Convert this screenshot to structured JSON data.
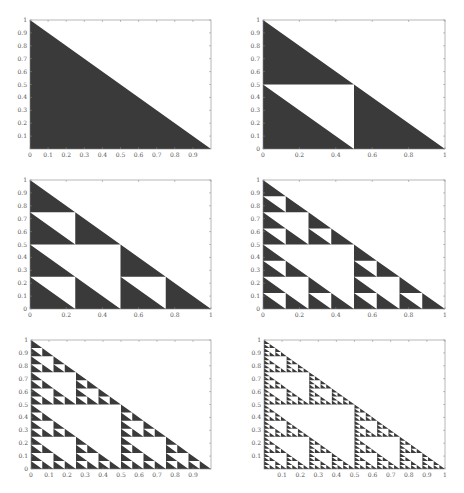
{
  "figure": {
    "fill_color": "#3a3a3a",
    "axis_color": "#888888",
    "background": "#ffffff"
  },
  "chart_data": [
    {
      "type": "area",
      "title": "",
      "description": "Right triangle with vertices (0,0),(1,0),(0,1) — Sierpinski-like fractal level 0",
      "level": 0,
      "xlim": [
        0,
        1
      ],
      "ylim": [
        0,
        1
      ],
      "xticks": [
        "0",
        "0.1",
        "0.2",
        "0.3",
        "0.4",
        "0.5",
        "0.6",
        "0.7",
        "0.8",
        "0.9"
      ],
      "xtick_values": [
        0,
        0.1,
        0.2,
        0.3,
        0.4,
        0.5,
        0.6,
        0.7,
        0.8,
        0.9
      ],
      "yticks": [
        "0.1",
        "0.2",
        "0.3",
        "0.4",
        "0.5",
        "0.6",
        "0.7",
        "0.8",
        "0.9",
        "1"
      ],
      "ytick_values": [
        0.1,
        0.2,
        0.3,
        0.4,
        0.5,
        0.6,
        0.7,
        0.8,
        0.9,
        1
      ],
      "grid": false
    },
    {
      "type": "area",
      "description": "Fractal level 1: upper-left square [0,0.5]x[0,0.5] region split; white square removed",
      "level": 1,
      "xlim": [
        0,
        1
      ],
      "ylim": [
        0,
        1
      ],
      "xticks": [
        "0",
        "0.2",
        "0.4",
        "0.6",
        "0.8",
        "1"
      ],
      "xtick_values": [
        0,
        0.2,
        0.4,
        0.6,
        0.8,
        1
      ],
      "yticks": [
        "0",
        "0.1",
        "0.2",
        "0.3",
        "0.4",
        "0.5",
        "0.6",
        "0.7",
        "0.8",
        "0.9",
        "1"
      ],
      "ytick_values": [
        0,
        0.1,
        0.2,
        0.3,
        0.4,
        0.5,
        0.6,
        0.7,
        0.8,
        0.9,
        1
      ],
      "grid": false
    },
    {
      "type": "area",
      "description": "Fractal level 2",
      "level": 2,
      "xlim": [
        0,
        1
      ],
      "ylim": [
        0,
        1
      ],
      "xticks": [
        "0",
        "0.2",
        "0.4",
        "0.6",
        "0.8",
        "1"
      ],
      "xtick_values": [
        0,
        0.2,
        0.4,
        0.6,
        0.8,
        1
      ],
      "yticks": [
        "0",
        "0.1",
        "0.2",
        "0.3",
        "0.4",
        "0.5",
        "0.6",
        "0.7",
        "0.8",
        "0.9",
        "1"
      ],
      "ytick_values": [
        0,
        0.1,
        0.2,
        0.3,
        0.4,
        0.5,
        0.6,
        0.7,
        0.8,
        0.9,
        1
      ],
      "grid": false
    },
    {
      "type": "area",
      "description": "Fractal level 3",
      "level": 3,
      "xlim": [
        0,
        1
      ],
      "ylim": [
        0,
        1
      ],
      "xticks": [
        "0",
        "0.2",
        "0.4",
        "0.6",
        "0.8",
        "1"
      ],
      "xtick_values": [
        0,
        0.2,
        0.4,
        0.6,
        0.8,
        1
      ],
      "yticks": [
        "0",
        "0.1",
        "0.2",
        "0.3",
        "0.4",
        "0.5",
        "0.6",
        "0.7",
        "0.8",
        "0.9",
        "1"
      ],
      "ytick_values": [
        0,
        0.1,
        0.2,
        0.3,
        0.4,
        0.5,
        0.6,
        0.7,
        0.8,
        0.9,
        1
      ],
      "grid": false
    },
    {
      "type": "area",
      "description": "Fractal level 4",
      "level": 4,
      "xlim": [
        0,
        1
      ],
      "ylim": [
        0,
        1
      ],
      "xticks": [
        "0",
        "0.1",
        "0.2",
        "0.3",
        "0.4",
        "0.5",
        "0.6",
        "0.7",
        "0.8",
        "0.9"
      ],
      "xtick_values": [
        0,
        0.1,
        0.2,
        0.3,
        0.4,
        0.5,
        0.6,
        0.7,
        0.8,
        0.9
      ],
      "yticks": [
        "0",
        "0.1",
        "0.2",
        "0.3",
        "0.4",
        "0.5",
        "0.6",
        "0.7",
        "0.8",
        "0.9",
        "1"
      ],
      "ytick_values": [
        0,
        0.1,
        0.2,
        0.3,
        0.4,
        0.5,
        0.6,
        0.7,
        0.8,
        0.9,
        1
      ],
      "grid": false
    },
    {
      "type": "area",
      "description": "Fractal level 5",
      "level": 5,
      "xlim": [
        0,
        1
      ],
      "ylim": [
        0,
        1
      ],
      "xticks": [
        "0.1",
        "0.2",
        "0.3",
        "0.4",
        "0.5",
        "0.6",
        "0.7",
        "0.8",
        "0.9",
        "1"
      ],
      "xtick_values": [
        0.1,
        0.2,
        0.3,
        0.4,
        0.5,
        0.6,
        0.7,
        0.8,
        0.9,
        1
      ],
      "yticks": [
        "0.1",
        "0.2",
        "0.3",
        "0.4",
        "0.5",
        "0.6",
        "0.7",
        "0.8",
        "0.9",
        "1"
      ],
      "ytick_values": [
        0.1,
        0.2,
        0.3,
        0.4,
        0.5,
        0.6,
        0.7,
        0.8,
        0.9,
        1
      ],
      "grid": false
    }
  ],
  "layout": {
    "panels": [
      {
        "left": 30,
        "top": 20,
        "width": 181,
        "height": 129
      },
      {
        "left": 263,
        "top": 20,
        "width": 182,
        "height": 129
      },
      {
        "left": 30,
        "top": 180,
        "width": 181,
        "height": 129
      },
      {
        "left": 263,
        "top": 180,
        "width": 182,
        "height": 129
      },
      {
        "left": 31,
        "top": 340,
        "width": 180,
        "height": 129
      },
      {
        "left": 264,
        "top": 340,
        "width": 181,
        "height": 129
      }
    ]
  }
}
